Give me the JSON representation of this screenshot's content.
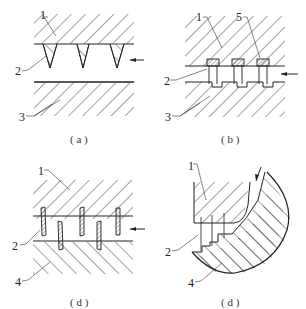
{
  "panels": [
    {
      "id": "a",
      "caption": "( a )",
      "labels": {
        "l1": "1",
        "l2": "2",
        "l3": "3"
      }
    },
    {
      "id": "b",
      "caption": "( b )",
      "labels": {
        "l1": "1",
        "l5": "5",
        "l2": "2",
        "l3": "3"
      }
    },
    {
      "id": "d1",
      "caption": "( d )",
      "labels": {
        "l1": "1",
        "l2": "2",
        "l4": "4"
      }
    },
    {
      "id": "d2",
      "caption": "( d )",
      "labels": {
        "l1": "1",
        "l2": "2",
        "l4": "4"
      }
    }
  ]
}
